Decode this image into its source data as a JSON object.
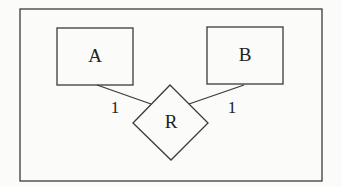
{
  "diagram": {
    "type": "entity-relationship",
    "entities": [
      {
        "id": "A",
        "label": "A"
      },
      {
        "id": "B",
        "label": "B"
      }
    ],
    "relationships": [
      {
        "id": "R",
        "label": "R",
        "connects": [
          "A",
          "B"
        ],
        "cardinalities": [
          "1",
          "1"
        ]
      }
    ],
    "cardinality_labels": {
      "a_side": "1",
      "b_side": "1"
    }
  }
}
